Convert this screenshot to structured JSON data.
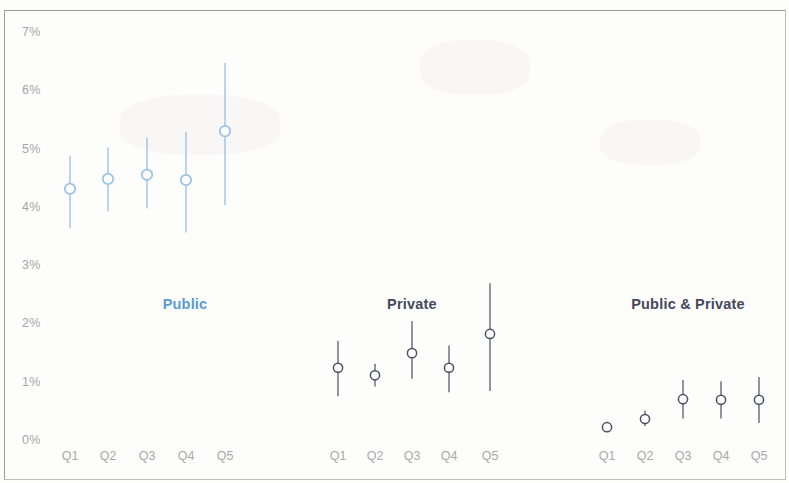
{
  "chart_data": {
    "type": "scatter",
    "title": "",
    "subtitle": "",
    "xlabel": "",
    "ylabel": "",
    "ylim": [
      0,
      7
    ],
    "ytick_labels": [
      "0%",
      "1%",
      "2%",
      "3%",
      "4%",
      "5%",
      "6%",
      "7%"
    ],
    "ytick_values": [
      0,
      1,
      2,
      3,
      4,
      5,
      6,
      7
    ],
    "grid": false,
    "legend_position": "inline-group-labels",
    "units": "percent",
    "categories": [
      "Q1",
      "Q2",
      "Q3",
      "Q4",
      "Q5"
    ],
    "series": [
      {
        "name": "Public",
        "color": "#9cc3e5",
        "label_color": "#5b9bd5",
        "values": [
          4.31,
          4.48,
          4.55,
          4.46,
          5.3
        ],
        "ci_low": [
          3.64,
          3.92,
          3.97,
          3.56,
          4.03
        ],
        "ci_high": [
          4.87,
          5.02,
          5.19,
          5.29,
          6.47
        ]
      },
      {
        "name": "Private",
        "color": "#4b4f63",
        "label_color": "#44485c",
        "values": [
          1.24,
          1.11,
          1.49,
          1.24,
          1.82
        ],
        "ci_low": [
          0.75,
          0.92,
          1.05,
          0.82,
          0.84
        ],
        "ci_high": [
          1.7,
          1.31,
          2.04,
          1.62,
          2.69
        ]
      },
      {
        "name": "Public & Private",
        "color": "#4b4f63",
        "label_color": "#44485c",
        "values": [
          0.22,
          0.36,
          0.7,
          0.69,
          0.69
        ],
        "ci_low": [
          0.22,
          0.24,
          0.37,
          0.37,
          0.29
        ],
        "ci_high": [
          0.22,
          0.5,
          1.03,
          1.01,
          1.08
        ]
      }
    ]
  },
  "axis": {
    "y_top_value": 7,
    "y_bottom_value": 0,
    "y_top_px": 32,
    "y_bottom_px": 440
  },
  "groups_layout": [
    {
      "name": "Public",
      "label_x": 185,
      "label_y": 296,
      "x_positions": [
        70,
        108,
        147,
        186,
        225
      ]
    },
    {
      "name": "Private",
      "label_x": 412,
      "label_y": 296,
      "x_positions": [
        338,
        375,
        412,
        449,
        490
      ]
    },
    {
      "name": "Public & Private",
      "label_x": 688,
      "label_y": 296,
      "x_positions": [
        607,
        645,
        683,
        721,
        759
      ]
    }
  ]
}
